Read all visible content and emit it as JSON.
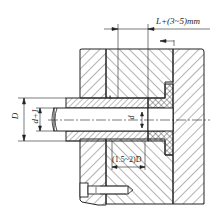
{
  "diagram": {
    "type": "engineering-cross-section",
    "colors": {
      "line": "#222222",
      "background": "#ffffff",
      "hatch": "#333333"
    },
    "dimensions": {
      "top_clearance": "L+(3~5)mm",
      "outer_diameter": "D",
      "inner_diameter": "d+1",
      "rod_diameter": "d",
      "length_ratio": "(1.5~2)D"
    },
    "components": [
      {
        "name": "left-plate",
        "label": ""
      },
      {
        "name": "middle-plate",
        "label": ""
      },
      {
        "name": "right-plate",
        "label": ""
      },
      {
        "name": "sleeve",
        "label": ""
      },
      {
        "name": "rod",
        "label": ""
      },
      {
        "name": "seal-insert",
        "label": ""
      },
      {
        "name": "fastening-screw",
        "label": ""
      }
    ]
  }
}
